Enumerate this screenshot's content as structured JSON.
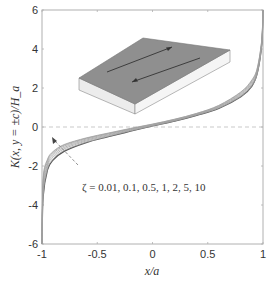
{
  "chart_data": {
    "type": "line",
    "title": "",
    "xlabel": "x/a",
    "ylabel": "K(x, y = ±c)/H_a",
    "xlim": [
      -1,
      1
    ],
    "ylim": [
      -6,
      6
    ],
    "xticks": [
      -1,
      -0.5,
      0,
      0.5,
      1
    ],
    "xtick_labels": [
      "-1",
      "-0.5",
      "0",
      "0.5",
      "1"
    ],
    "yticks": [
      -6,
      -4,
      -2,
      0,
      2,
      4,
      6
    ],
    "ytick_labels": [
      "-6",
      "-4",
      "-2",
      "0",
      "2",
      "4",
      "6"
    ],
    "grid": false,
    "reference_line": {
      "y": 0,
      "style": "dashed"
    },
    "annotation": "ζ = 0.01, 0.1, 0.5, 1, 2, 5, 10",
    "annotation_arrow": {
      "from": [
        -0.62,
        -1.9
      ],
      "to": [
        -0.85,
        -0.6
      ]
    },
    "inset": "3D slab with top surface shaded, two antiparallel arrows on top face",
    "series": [
      {
        "name": "ζ = 0.01",
        "x": [
          -0.999,
          -0.99,
          -0.95,
          -0.9,
          -0.8,
          -0.6,
          -0.4,
          -0.2,
          0,
          0.2,
          0.4,
          0.6,
          0.8,
          0.9,
          0.95,
          0.99,
          0.999
        ],
        "values": [
          -6,
          -3.6,
          -2.2,
          -1.7,
          -1.25,
          -0.8,
          -0.5,
          -0.22,
          0.05,
          0.3,
          0.6,
          0.95,
          1.55,
          2.1,
          2.8,
          4.3,
          6
        ]
      },
      {
        "name": "ζ = 0.1",
        "x": [
          -0.999,
          -0.99,
          -0.95,
          -0.9,
          -0.8,
          -0.6,
          -0.4,
          -0.2,
          0,
          0.2,
          0.4,
          0.6,
          0.8,
          0.9,
          0.95,
          0.99,
          0.999
        ],
        "values": [
          -6,
          -3.5,
          -2.15,
          -1.65,
          -1.2,
          -0.78,
          -0.48,
          -0.2,
          0.06,
          0.31,
          0.61,
          0.97,
          1.57,
          2.12,
          2.8,
          4.3,
          6
        ]
      },
      {
        "name": "ζ = 0.5",
        "x": [
          -0.999,
          -0.99,
          -0.95,
          -0.9,
          -0.8,
          -0.6,
          -0.4,
          -0.2,
          0,
          0.2,
          0.4,
          0.6,
          0.8,
          0.9,
          0.95,
          0.99,
          0.999
        ],
        "values": [
          -6,
          -3.3,
          -2.0,
          -1.55,
          -1.12,
          -0.72,
          -0.44,
          -0.17,
          0.08,
          0.33,
          0.63,
          1.0,
          1.62,
          2.18,
          2.85,
          4.35,
          6
        ]
      },
      {
        "name": "ζ = 1",
        "x": [
          -0.999,
          -0.99,
          -0.95,
          -0.9,
          -0.8,
          -0.6,
          -0.4,
          -0.2,
          0,
          0.2,
          0.4,
          0.6,
          0.8,
          0.9,
          0.95,
          0.99,
          0.999
        ],
        "values": [
          -6,
          -3.1,
          -1.9,
          -1.45,
          -1.05,
          -0.67,
          -0.4,
          -0.14,
          0.1,
          0.35,
          0.65,
          1.03,
          1.67,
          2.25,
          2.9,
          4.4,
          6
        ]
      },
      {
        "name": "ζ = 2",
        "x": [
          -0.999,
          -0.99,
          -0.95,
          -0.9,
          -0.8,
          -0.6,
          -0.4,
          -0.2,
          0,
          0.2,
          0.4,
          0.6,
          0.8,
          0.9,
          0.95,
          0.99,
          0.999
        ],
        "values": [
          -6,
          -2.9,
          -1.78,
          -1.36,
          -0.98,
          -0.62,
          -0.36,
          -0.11,
          0.12,
          0.37,
          0.67,
          1.06,
          1.72,
          2.32,
          2.97,
          4.45,
          6
        ]
      },
      {
        "name": "ζ = 5",
        "x": [
          -0.999,
          -0.99,
          -0.95,
          -0.9,
          -0.8,
          -0.6,
          -0.4,
          -0.2,
          0,
          0.2,
          0.4,
          0.6,
          0.8,
          0.9,
          0.95,
          0.99,
          0.999
        ],
        "values": [
          -6,
          -2.75,
          -1.7,
          -1.3,
          -0.93,
          -0.58,
          -0.33,
          -0.09,
          0.14,
          0.39,
          0.69,
          1.09,
          1.77,
          2.38,
          3.03,
          4.5,
          6
        ]
      },
      {
        "name": "ζ = 10",
        "x": [
          -0.999,
          -0.99,
          -0.95,
          -0.9,
          -0.8,
          -0.6,
          -0.4,
          -0.2,
          0,
          0.2,
          0.4,
          0.6,
          0.8,
          0.9,
          0.95,
          0.99,
          0.999
        ],
        "values": [
          -6,
          -2.65,
          -1.65,
          -1.26,
          -0.9,
          -0.56,
          -0.31,
          -0.07,
          0.15,
          0.4,
          0.7,
          1.11,
          1.8,
          2.42,
          3.07,
          4.55,
          6
        ]
      }
    ]
  },
  "colors": {
    "axis": "#b0b0b0",
    "text": "#333333",
    "curve_dark": "#555555",
    "curve_light": "#a0a0a0",
    "zero_line": "#bbbbbb",
    "slab_top": "#8c8c8c",
    "slab_front": "#ececec",
    "slab_side": "#f4f4f4"
  }
}
